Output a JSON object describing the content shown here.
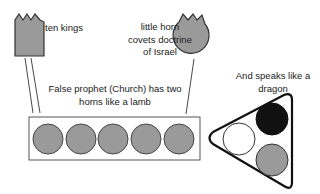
{
  "labels": {
    "ten_kings": "ten kings",
    "little_horn": [
      "little horn",
      "covets doctrine",
      "of Israel"
    ],
    "false_prophet": [
      "False prophet (Church) has two",
      "horns like a lamb"
    ],
    "dragon": [
      "And speaks like a",
      "dragon"
    ]
  },
  "shapes": {
    "ten_kings": {
      "type": "crowned-rectangle",
      "fill": "#9a9a9a"
    },
    "little_horn": {
      "type": "crowned-circle",
      "fill": "#9a9a9a"
    },
    "lamb_box": {
      "type": "rectangle",
      "circle_count": 5,
      "circle_fill": "#9a9a9a"
    },
    "dragon_triangle": {
      "type": "rounded-triangle",
      "circles": [
        {
          "position": "left",
          "fill": "#ffffff"
        },
        {
          "position": "top-right",
          "fill": "#111111"
        },
        {
          "position": "bottom-right",
          "fill": "#9a9a9a"
        }
      ]
    }
  },
  "colors": {
    "gray": "#9a9a9a",
    "stroke": "#333333",
    "black": "#111111"
  }
}
